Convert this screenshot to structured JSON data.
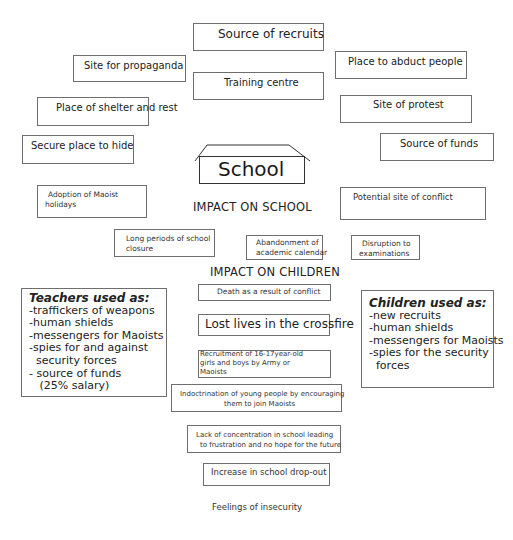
{
  "diagram": {
    "center": {
      "label": "School"
    },
    "school_uses": [
      "Source of recruits",
      "Site for propaganda",
      "Training centre",
      "Place to abduct people",
      "Place of shelter and rest",
      "Site of protest",
      "Secure place to hide",
      "Source of funds",
      "Potential site of conflict"
    ],
    "impact_on_school": {
      "heading": "IMPACT ON SCHOOL",
      "items": [
        {
          "lines": [
            "Adoption of Maoist",
            "holidays"
          ]
        },
        {
          "lines": [
            "Long periods of school",
            "closure"
          ]
        },
        {
          "lines": [
            "Abandonment of",
            "academic calendar"
          ]
        },
        {
          "lines": [
            "Disruption to",
            "examinations"
          ]
        }
      ]
    },
    "impact_on_children": {
      "heading": "IMPACT ON CHILDREN",
      "items": [
        {
          "lines": [
            "Death as a result of conflict"
          ]
        },
        {
          "lines": [
            "Lost lives in the crossfire"
          ]
        },
        {
          "lines": [
            "Recruitment of 16-17year-old",
            "girls and boys by Army or",
            "Maoists"
          ]
        },
        {
          "lines": [
            "Indoctrination of young people by encouraging",
            "them to join Maoists"
          ]
        },
        {
          "lines": [
            "Lack of concentration in school leading",
            "to frustration and no hope for the future"
          ]
        },
        {
          "lines": [
            "Increase in school drop-out"
          ]
        },
        {
          "lines": [
            "Feelings of insecurity"
          ]
        }
      ]
    },
    "teachers": {
      "title": "Teachers used as:",
      "lines": [
        "-traffickers of weapons",
        "-human shields",
        "-messengers for Maoists",
        "-spies for and against",
        "  security forces",
        "- source of funds",
        "   (25% salary)"
      ]
    },
    "children": {
      "title": "Children used as:",
      "lines": [
        "-new recruits",
        "-human shields",
        "-messengers for Maoists",
        "-spies for the security",
        "  forces"
      ]
    }
  }
}
